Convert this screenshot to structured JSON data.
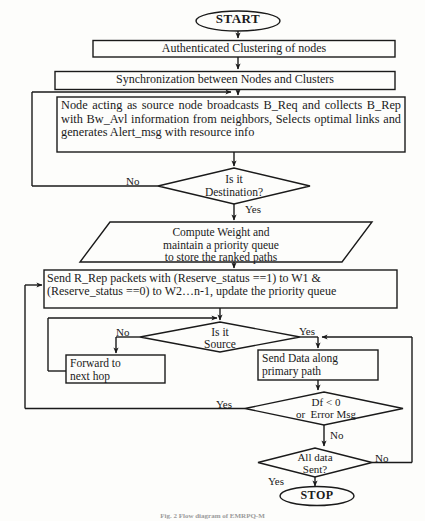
{
  "figure": {
    "caption": "Fig. 2 Flow diagram of EMRPQ-M",
    "line_color": "#1a1a1a",
    "text_color": "#1a1a1a",
    "background": "#fdfdfb"
  },
  "nodes": {
    "start": {
      "label": "START",
      "shape": "terminator"
    },
    "auth": {
      "label": "Authenticated Clustering of nodes",
      "shape": "process"
    },
    "sync": {
      "label": "Synchronization between Nodes and Clusters",
      "shape": "process"
    },
    "broadcast": {
      "label": "Node acting as source node broadcasts B_Req and collects B_Rep with Bw_Avl information from neighbors, Selects optimal links and generates Alert_msg with resource info",
      "shape": "process"
    },
    "is_destination": {
      "label": "Is it\nDestination?",
      "shape": "decision"
    },
    "compute_weight": {
      "label": "Compute Weight and\nmaintain a priority queue\nto store the ranked paths",
      "shape": "data"
    },
    "send_rrep": {
      "label": "Send R_Rep packets with (Reserve_status ==1) to W1 & (Reserve_status ==0) to W2…n-1, update the priority queue",
      "shape": "process"
    },
    "is_source": {
      "label": "Is it\nSource",
      "shape": "decision"
    },
    "forward_hop": {
      "label": "Forward to\nnext hop",
      "shape": "process"
    },
    "send_data": {
      "label": "Send Data along\nprimary path",
      "shape": "process"
    },
    "df_error": {
      "label": "Df < 0\nor  Error Msg",
      "shape": "decision"
    },
    "all_sent": {
      "label": "All data\nSent?",
      "shape": "decision"
    },
    "stop": {
      "label": "STOP",
      "shape": "terminator"
    }
  },
  "edge_labels": {
    "destination_no": "No",
    "destination_yes": "Yes",
    "source_no": "No",
    "source_yes": "Yes",
    "df_yes": "Yes",
    "df_no": "No",
    "allsent_no": "No",
    "allsent_yes": "Yes"
  }
}
